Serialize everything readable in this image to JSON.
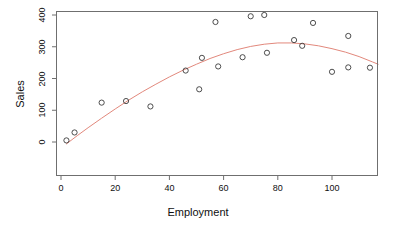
{
  "chart_data": {
    "type": "scatter",
    "title": "",
    "xlabel": "Employment",
    "ylabel": "Sales",
    "xlim": [
      -2,
      119
    ],
    "ylim": [
      -12,
      415
    ],
    "xticks": [
      0,
      20,
      40,
      60,
      80,
      100
    ],
    "yticks": [
      0,
      100,
      200,
      300,
      400
    ],
    "xtick_labels": [
      "0",
      "20",
      "40",
      "60",
      "80",
      "100"
    ],
    "ytick_labels": [
      "0",
      "100",
      "200",
      "300",
      "400"
    ],
    "grid": false,
    "legend": null,
    "marker": "open-circle",
    "marker_color": "#3a3a3a",
    "points": [
      {
        "x": 2,
        "y": 5
      },
      {
        "x": 5,
        "y": 30
      },
      {
        "x": 15,
        "y": 124
      },
      {
        "x": 24,
        "y": 129
      },
      {
        "x": 33,
        "y": 112
      },
      {
        "x": 46,
        "y": 225
      },
      {
        "x": 51,
        "y": 166
      },
      {
        "x": 52,
        "y": 265
      },
      {
        "x": 57,
        "y": 378
      },
      {
        "x": 58,
        "y": 238
      },
      {
        "x": 67,
        "y": 267
      },
      {
        "x": 70,
        "y": 396
      },
      {
        "x": 75,
        "y": 400
      },
      {
        "x": 76,
        "y": 281
      },
      {
        "x": 86,
        "y": 321
      },
      {
        "x": 89,
        "y": 303
      },
      {
        "x": 93,
        "y": 375
      },
      {
        "x": 100,
        "y": 221
      },
      {
        "x": 106,
        "y": 334
      },
      {
        "x": 106,
        "y": 235
      },
      {
        "x": 114,
        "y": 234
      }
    ],
    "fit": {
      "name": "quadratic-fit",
      "color": "#e2887c",
      "linewidth": 1,
      "peak": {
        "x": 82,
        "y": 312
      },
      "curve": [
        {
          "x": 2,
          "y": -6
        },
        {
          "x": 6,
          "y": 20
        },
        {
          "x": 10,
          "y": 45
        },
        {
          "x": 15,
          "y": 75
        },
        {
          "x": 20,
          "y": 104
        },
        {
          "x": 25,
          "y": 132
        },
        {
          "x": 30,
          "y": 158
        },
        {
          "x": 35,
          "y": 182
        },
        {
          "x": 40,
          "y": 205
        },
        {
          "x": 45,
          "y": 226
        },
        {
          "x": 50,
          "y": 245
        },
        {
          "x": 55,
          "y": 263
        },
        {
          "x": 60,
          "y": 278
        },
        {
          "x": 65,
          "y": 291
        },
        {
          "x": 70,
          "y": 301
        },
        {
          "x": 75,
          "y": 308
        },
        {
          "x": 80,
          "y": 312
        },
        {
          "x": 85,
          "y": 312
        },
        {
          "x": 90,
          "y": 309
        },
        {
          "x": 95,
          "y": 303
        },
        {
          "x": 100,
          "y": 294
        },
        {
          "x": 105,
          "y": 283
        },
        {
          "x": 110,
          "y": 269
        },
        {
          "x": 115,
          "y": 252
        },
        {
          "x": 117,
          "y": 245
        }
      ]
    }
  }
}
